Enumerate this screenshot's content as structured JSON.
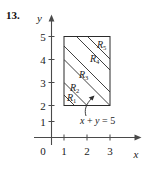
{
  "figure": {
    "problem_number": "13.",
    "axes": {
      "y_label": "y",
      "x_label": "x",
      "origin_label": "0",
      "y_ticks": [
        "5",
        "4",
        "3",
        "2",
        "1"
      ],
      "x_ticks": [
        "1",
        "2",
        "3"
      ],
      "y_range": [
        0,
        5.6
      ],
      "x_range": [
        0,
        4
      ]
    },
    "shape": {
      "name": "rectangle",
      "x_from": 1,
      "x_to": 3,
      "y_from": 2,
      "y_to": 5
    },
    "regions": [
      {
        "id": "R1",
        "base": "R",
        "sub": "1"
      },
      {
        "id": "R2",
        "base": "R",
        "sub": "2"
      },
      {
        "id": "R3",
        "base": "R",
        "sub": "3"
      },
      {
        "id": "R4",
        "base": "R",
        "sub": "4"
      },
      {
        "id": "R5",
        "base": "R",
        "sub": "5"
      }
    ],
    "annotation": {
      "equation": "x + y = 5",
      "eq_lhs_x": "x",
      "eq_plus": "+",
      "eq_lhs_y": "y",
      "eq_equals": "=",
      "eq_rhs": "5"
    },
    "colors": {
      "background": "#ffffff",
      "ink": "#1a1a1a",
      "axis": "#4a4a4a",
      "shape_stroke": "#2b2b2b"
    }
  }
}
